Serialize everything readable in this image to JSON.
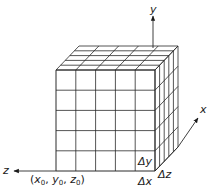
{
  "diagram": {
    "colors": {
      "line": "#2a2a2a",
      "background": "#ffffff"
    },
    "cube": {
      "front_top_left": [
        56,
        70
      ],
      "front_bottom_right": [
        155,
        171
      ],
      "depth_vector": [
        23,
        -24
      ],
      "divisions": {
        "x": 5,
        "y": 5,
        "z": 5
      }
    },
    "axes": {
      "y": {
        "label": "y",
        "from": [
          153,
          48
        ],
        "to": [
          153,
          16
        ]
      },
      "z": {
        "label": "z",
        "from": [
          56,
          171
        ],
        "to": [
          14,
          171
        ]
      },
      "x": {
        "label": "x",
        "from": [
          178,
          147
        ],
        "to": [
          198,
          118
        ]
      }
    },
    "labels": {
      "axis_y": "y",
      "axis_z": "z",
      "axis_x": "x",
      "delta_y": "Δy",
      "delta_z": "Δz",
      "delta_x": "Δx",
      "origin_prefix": "(",
      "origin_x": "x",
      "origin_y": "y",
      "origin_z": "z",
      "origin_sub": "0",
      "origin_sep": ", ",
      "origin_suffix": ")"
    }
  }
}
